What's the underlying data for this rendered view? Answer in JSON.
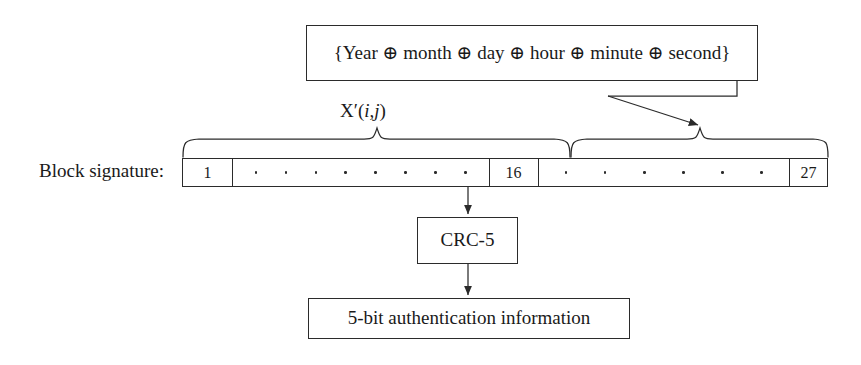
{
  "figure": {
    "background_color": "#ffffff",
    "line_color": "#2b2b2b"
  },
  "timestamp_box": {
    "text": "{Year ⊕ month ⊕ day ⊕ hour ⊕ minute ⊕ second}"
  },
  "signature": {
    "label": "Block signature:",
    "cells": [
      {
        "type": "number",
        "value": "1"
      },
      {
        "type": "dots",
        "count": 8
      },
      {
        "type": "number",
        "value": "16"
      },
      {
        "type": "dots",
        "count": 6
      },
      {
        "type": "number",
        "value": "27"
      }
    ]
  },
  "braces": {
    "left": {
      "label_prefix": "X′(",
      "label_i": "i",
      "label_comma": ",",
      "label_j": "j",
      "label_suffix": ")"
    }
  },
  "crc_box": {
    "text": "CRC-5"
  },
  "output_box": {
    "text": "5-bit authentication information"
  }
}
